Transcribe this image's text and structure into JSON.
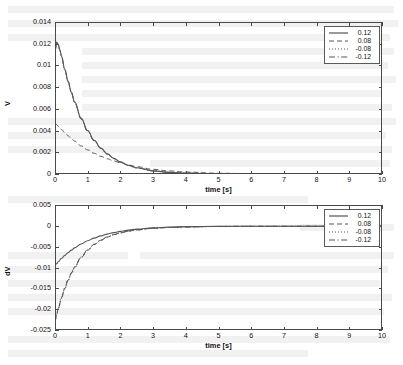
{
  "figure": {
    "background_color": "#ffffff",
    "axis_color": "#4a4a4a",
    "curve_color": "#555555"
  },
  "bleed_through": {
    "description": "faint reverse-side printed text visible through the scanned page",
    "lines": [
      {
        "x": 8,
        "y": 6,
        "w": 386
      },
      {
        "x": 8,
        "y": 20,
        "w": 390
      },
      {
        "x": 8,
        "y": 34,
        "w": 382
      },
      {
        "x": 82,
        "y": 48,
        "w": 312
      },
      {
        "x": 82,
        "y": 62,
        "w": 306
      },
      {
        "x": 82,
        "y": 76,
        "w": 314
      },
      {
        "x": 82,
        "y": 90,
        "w": 300
      },
      {
        "x": 82,
        "y": 104,
        "w": 310
      },
      {
        "x": 8,
        "y": 118,
        "w": 388
      },
      {
        "x": 8,
        "y": 132,
        "w": 378
      },
      {
        "x": 8,
        "y": 146,
        "w": 384
      },
      {
        "x": 150,
        "y": 160,
        "w": 240
      },
      {
        "x": 8,
        "y": 196,
        "w": 300
      },
      {
        "x": 300,
        "y": 224,
        "w": 94
      },
      {
        "x": 8,
        "y": 252,
        "w": 120
      },
      {
        "x": 140,
        "y": 252,
        "w": 254
      },
      {
        "x": 8,
        "y": 266,
        "w": 380
      },
      {
        "x": 8,
        "y": 280,
        "w": 372
      },
      {
        "x": 8,
        "y": 294,
        "w": 384
      },
      {
        "x": 8,
        "y": 308,
        "w": 376
      },
      {
        "x": 8,
        "y": 336,
        "w": 382
      },
      {
        "x": 8,
        "y": 350,
        "w": 300
      }
    ]
  },
  "chart_data": [
    {
      "id": "top",
      "type": "line",
      "title": "",
      "xlabel": "time [s]",
      "ylabel": "V",
      "xlim": [
        0,
        10
      ],
      "ylim": [
        0,
        0.014
      ],
      "xticks": [
        0,
        1,
        2,
        3,
        4,
        5,
        6,
        7,
        8,
        9,
        10
      ],
      "xtick_labels": [
        "0",
        "1",
        "2",
        "3",
        "4",
        "5",
        "6",
        "7",
        "8",
        "9",
        "10"
      ],
      "yticks": [
        0,
        0.002,
        0.004,
        0.006,
        0.008,
        0.01,
        0.012,
        0.014
      ],
      "ytick_labels": [
        "0",
        "0.002",
        "0.004",
        "0.006",
        "0.008",
        "0.01",
        "0.012",
        "0.014"
      ],
      "grid": false,
      "legend_position": "top-right",
      "series": [
        {
          "name": "0.12",
          "style": "solid",
          "x": [
            0,
            0.05,
            0.1,
            0.15,
            0.2,
            0.3,
            0.4,
            0.5,
            0.6,
            0.8,
            1.0,
            1.2,
            1.4,
            1.6,
            1.8,
            2.0,
            2.25,
            2.5,
            3.0,
            3.5,
            4.0,
            5.0,
            6.0,
            7.0,
            8.0,
            9.0,
            10.0
          ],
          "values": [
            0.0113,
            0.01215,
            0.01195,
            0.01145,
            0.01085,
            0.00965,
            0.00855,
            0.00755,
            0.00665,
            0.00515,
            0.004,
            0.0031,
            0.0024,
            0.00186,
            0.00144,
            0.00112,
            0.0008,
            0.00057,
            0.00029,
            0.00015,
            8e-05,
            2e-05,
            1e-05,
            5e-06,
            2e-06,
            1e-06,
            5e-07
          ]
        },
        {
          "name": "0.08",
          "style": "dashed",
          "x": [
            0,
            0.05,
            0.1,
            0.2,
            0.3,
            0.4,
            0.5,
            0.6,
            0.8,
            1.0,
            1.2,
            1.4,
            1.6,
            1.8,
            2.0,
            2.25,
            2.5,
            3.0,
            3.5,
            4.0,
            5.0,
            6.0,
            7.0,
            8.0,
            9.0,
            10.0
          ],
          "values": [
            0.00465,
            0.00455,
            0.0044,
            0.0041,
            0.0038,
            0.00352,
            0.00326,
            0.00302,
            0.00259,
            0.00222,
            0.0019,
            0.00163,
            0.0014,
            0.0012,
            0.00103,
            0.00083,
            0.00067,
            0.00043,
            0.00028,
            0.00018,
            7e-05,
            3e-05,
            1e-05,
            5e-06,
            2e-06,
            1e-06
          ]
        },
        {
          "name": "-0.08",
          "style": "dotted",
          "x": [
            0,
            0.05,
            0.1,
            0.15,
            0.2,
            0.3,
            0.4,
            0.5,
            0.6,
            0.8,
            1.0,
            1.2,
            1.4,
            1.6,
            1.8,
            2.0,
            2.25,
            2.5,
            3.0,
            3.5,
            4.0,
            5.0,
            6.0,
            7.0,
            8.0,
            9.0,
            10.0
          ],
          "values": [
            0.0113,
            0.0121,
            0.0119,
            0.0114,
            0.0108,
            0.0096,
            0.0085,
            0.0075,
            0.0066,
            0.0051,
            0.00396,
            0.00307,
            0.00238,
            0.00184,
            0.00142,
            0.0011,
            0.00079,
            0.00056,
            0.00029,
            0.00015,
            8e-05,
            2e-05,
            1e-05,
            5e-06,
            2e-06,
            1e-06,
            5e-07
          ]
        },
        {
          "name": "-0.12",
          "style": "dashdot",
          "x": [
            0,
            0.05,
            0.1,
            0.15,
            0.2,
            0.3,
            0.4,
            0.5,
            0.6,
            0.8,
            1.0,
            1.2,
            1.4,
            1.6,
            1.8,
            2.0,
            2.25,
            2.5,
            3.0,
            3.5,
            4.0,
            5.0,
            6.0,
            7.0,
            8.0,
            9.0,
            10.0
          ],
          "values": [
            0.0113,
            0.01205,
            0.01185,
            0.01135,
            0.01075,
            0.00955,
            0.00845,
            0.00746,
            0.00656,
            0.00506,
            0.00392,
            0.00304,
            0.00235,
            0.00182,
            0.00141,
            0.00109,
            0.00078,
            0.00055,
            0.00028,
            0.00014,
            7e-05,
            2e-05,
            1e-05,
            5e-06,
            2e-06,
            1e-06,
            5e-07
          ]
        }
      ],
      "legend": [
        {
          "label": "0.12",
          "style": "solid"
        },
        {
          "label": "0.08",
          "style": "dashed"
        },
        {
          "label": "-0.08",
          "style": "dotted"
        },
        {
          "label": "-0.12",
          "style": "dashdot"
        }
      ]
    },
    {
      "id": "bottom",
      "type": "line",
      "title": "",
      "xlabel": "time [s]",
      "ylabel": "dV",
      "xlim": [
        0,
        10
      ],
      "ylim": [
        -0.025,
        0.005
      ],
      "xticks": [
        0,
        1,
        2,
        3,
        4,
        5,
        6,
        7,
        8,
        9,
        10
      ],
      "xtick_labels": [
        "0",
        "1",
        "2",
        "3",
        "4",
        "5",
        "6",
        "7",
        "8",
        "9",
        "10"
      ],
      "yticks": [
        -0.025,
        -0.02,
        -0.015,
        -0.01,
        -0.005,
        0,
        0.005
      ],
      "ytick_labels": [
        "-0.025",
        "-0.02",
        "-0.015",
        "-0.01",
        "-0.005",
        "0",
        "0.005"
      ],
      "grid": false,
      "legend_position": "top-right",
      "series": [
        {
          "name": "0.12",
          "style": "solid",
          "x": [
            0,
            0.05,
            0.1,
            0.2,
            0.3,
            0.4,
            0.5,
            0.6,
            0.8,
            1.0,
            1.2,
            1.4,
            1.6,
            1.8,
            2.0,
            2.25,
            2.5,
            3.0,
            3.5,
            4.0,
            5.0,
            6.0,
            7.0,
            8.0,
            9.0,
            10.0
          ],
          "values": [
            -0.0095,
            -0.00905,
            -0.00862,
            -0.00782,
            -0.0071,
            -0.00644,
            -0.00584,
            -0.0053,
            -0.00436,
            -0.00358,
            -0.00294,
            -0.00241,
            -0.00198,
            -0.00162,
            -0.00133,
            -0.00103,
            -0.0008,
            -0.00048,
            -0.0003,
            -0.0002,
            -0.00012,
            -0.0001,
            -9e-05,
            -9e-05,
            -8e-05,
            -8e-05
          ]
        },
        {
          "name": "0.08",
          "style": "dashed",
          "x": [
            0,
            0.05,
            0.1,
            0.2,
            0.3,
            0.4,
            0.5,
            0.6,
            0.8,
            1.0,
            1.2,
            1.4,
            1.6,
            1.8,
            2.0,
            2.25,
            2.5,
            3.0,
            3.5,
            4.0,
            5.0,
            6.0,
            7.0,
            8.0,
            9.0,
            10.0
          ],
          "values": [
            -0.0229,
            -0.0213,
            -0.01985,
            -0.01725,
            -0.015,
            -0.01305,
            -0.01137,
            -0.00992,
            -0.00757,
            -0.0058,
            -0.00447,
            -0.00346,
            -0.0027,
            -0.00212,
            -0.00168,
            -0.00126,
            -0.00097,
            -0.00059,
            -0.00038,
            -0.00026,
            -0.00015,
            -0.00011,
            -0.0001,
            -9e-05,
            -9e-05,
            -8e-05
          ]
        },
        {
          "name": "-0.08",
          "style": "dotted",
          "x": [
            0,
            0.05,
            0.1,
            0.2,
            0.3,
            0.4,
            0.5,
            0.6,
            0.8,
            1.0,
            1.2,
            1.4,
            1.6,
            1.8,
            2.0,
            2.25,
            2.5,
            3.0,
            3.5,
            4.0,
            5.0,
            6.0,
            7.0,
            8.0,
            9.0,
            10.0
          ],
          "values": [
            -0.0231,
            -0.0215,
            -0.02,
            -0.0174,
            -0.01515,
            -0.0132,
            -0.0115,
            -0.01004,
            -0.00766,
            -0.00587,
            -0.00452,
            -0.0035,
            -0.00273,
            -0.00214,
            -0.0017,
            -0.00128,
            -0.00098,
            -0.0006,
            -0.00039,
            -0.00027,
            -0.00016,
            -0.00012,
            -0.0001,
            -0.0001,
            -9e-05,
            -9e-05
          ]
        },
        {
          "name": "-0.12",
          "style": "dashdot",
          "x": [
            0,
            0.05,
            0.1,
            0.2,
            0.3,
            0.4,
            0.5,
            0.6,
            0.8,
            1.0,
            1.2,
            1.4,
            1.6,
            1.8,
            2.0,
            2.25,
            2.5,
            3.0,
            3.5,
            4.0,
            5.0,
            6.0,
            7.0,
            8.0,
            9.0,
            10.0
          ],
          "values": [
            -0.0227,
            -0.02112,
            -0.01968,
            -0.0171,
            -0.01487,
            -0.01293,
            -0.01126,
            -0.00982,
            -0.00749,
            -0.00574,
            -0.00442,
            -0.00342,
            -0.00267,
            -0.0021,
            -0.00166,
            -0.00125,
            -0.00096,
            -0.00058,
            -0.00038,
            -0.00026,
            -0.00015,
            -0.00011,
            -0.0001,
            -9e-05,
            -9e-05,
            -8e-05
          ]
        }
      ],
      "legend": [
        {
          "label": "0.12",
          "style": "solid"
        },
        {
          "label": "0.08",
          "style": "dashed"
        },
        {
          "label": "-0.08",
          "style": "dotted"
        },
        {
          "label": "-0.12",
          "style": "dashdot"
        }
      ]
    }
  ]
}
